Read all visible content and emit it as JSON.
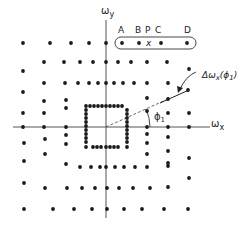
{
  "diagram": {
    "axes": {
      "x_label": "ω",
      "x_sub": "x",
      "y_label": "ω",
      "y_sub": "y",
      "origin": [
        106,
        127
      ]
    },
    "top_labels": [
      "A",
      "B",
      "P",
      "C",
      "D"
    ],
    "point_marker": "x",
    "annotation": {
      "text_main": "Δω",
      "text_sub": "x",
      "text_arg": "(ϕ",
      "text_arg_sub": "1",
      "text_close": ")"
    },
    "angle_label": {
      "main": "ϕ",
      "sub": "1"
    },
    "colors": {
      "dot": "#1a1a1a",
      "line": "#555555",
      "text": "#222222"
    },
    "dots": [
      [
        23,
        43
      ],
      [
        50,
        43
      ],
      [
        71,
        43
      ],
      [
        89,
        43
      ],
      [
        106,
        43
      ],
      [
        122,
        43
      ],
      [
        139,
        43
      ],
      [
        161,
        43
      ],
      [
        187,
        43
      ],
      [
        44,
        62
      ],
      [
        64,
        62
      ],
      [
        80,
        62
      ],
      [
        93,
        62
      ],
      [
        106,
        62
      ],
      [
        118,
        62
      ],
      [
        131,
        62
      ],
      [
        147,
        62
      ],
      [
        167,
        62
      ],
      [
        23,
        71
      ],
      [
        189,
        69
      ],
      [
        44,
        83
      ],
      [
        65,
        83
      ],
      [
        78,
        83
      ],
      [
        89,
        83
      ],
      [
        98,
        83
      ],
      [
        106,
        83
      ],
      [
        114,
        83
      ],
      [
        123,
        83
      ],
      [
        134,
        83
      ],
      [
        147,
        83
      ],
      [
        168,
        83
      ],
      [
        23,
        92
      ],
      [
        188,
        90
      ],
      [
        44,
        101
      ],
      [
        66,
        100
      ],
      [
        147,
        98
      ],
      [
        168,
        99
      ],
      [
        23,
        113
      ],
      [
        44,
        113
      ],
      [
        66,
        108
      ],
      [
        147,
        111
      ],
      [
        168,
        113
      ],
      [
        189,
        113
      ],
      [
        86,
        106
      ],
      [
        90,
        106
      ],
      [
        94,
        106
      ],
      [
        98,
        106
      ],
      [
        102,
        106
      ],
      [
        106,
        106
      ],
      [
        110,
        106
      ],
      [
        114,
        106
      ],
      [
        118,
        106
      ],
      [
        122,
        106
      ],
      [
        86,
        110
      ],
      [
        86,
        114
      ],
      [
        86,
        118
      ],
      [
        86,
        122
      ],
      [
        86,
        126
      ],
      [
        86,
        130
      ],
      [
        86,
        134
      ],
      [
        86,
        138
      ],
      [
        86,
        142
      ],
      [
        127,
        110
      ],
      [
        127,
        114
      ],
      [
        127,
        118
      ],
      [
        127,
        122
      ],
      [
        127,
        126
      ],
      [
        127,
        130
      ],
      [
        127,
        134
      ],
      [
        127,
        138
      ],
      [
        127,
        142
      ],
      [
        86,
        147
      ],
      [
        93,
        147
      ],
      [
        97,
        147
      ],
      [
        101,
        147
      ],
      [
        106,
        147
      ],
      [
        110,
        147
      ],
      [
        114,
        147
      ],
      [
        118,
        147
      ],
      [
        127,
        147
      ],
      [
        23,
        127
      ],
      [
        44,
        127
      ],
      [
        66,
        127
      ],
      [
        147,
        127
      ],
      [
        168,
        127
      ],
      [
        189,
        127
      ],
      [
        66,
        135
      ],
      [
        147,
        134
      ],
      [
        168,
        137
      ],
      [
        24,
        143
      ],
      [
        45,
        139
      ],
      [
        66,
        144
      ],
      [
        147,
        143
      ],
      [
        168,
        151
      ],
      [
        189,
        158
      ],
      [
        45,
        154
      ],
      [
        147,
        154
      ],
      [
        168,
        163
      ],
      [
        24,
        161
      ],
      [
        66,
        164
      ],
      [
        80,
        167
      ],
      [
        91,
        167
      ],
      [
        100,
        167
      ],
      [
        106,
        167
      ],
      [
        115,
        167
      ],
      [
        124,
        167
      ],
      [
        135,
        167
      ],
      [
        147,
        167
      ],
      [
        168,
        166
      ],
      [
        189,
        178
      ],
      [
        24,
        183
      ],
      [
        45,
        188
      ],
      [
        67,
        188
      ],
      [
        82,
        188
      ],
      [
        95,
        188
      ],
      [
        107,
        188
      ],
      [
        119,
        188
      ],
      [
        133,
        188
      ],
      [
        150,
        188
      ],
      [
        168,
        187
      ],
      [
        24,
        209
      ],
      [
        53,
        209
      ],
      [
        74,
        209
      ],
      [
        92,
        209
      ],
      [
        107,
        209
      ],
      [
        124,
        209
      ],
      [
        142,
        209
      ],
      [
        164,
        209
      ],
      [
        188,
        209
      ]
    ]
  }
}
